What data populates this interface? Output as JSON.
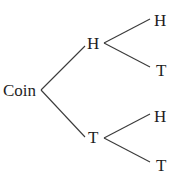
{
  "diagram": {
    "type": "probability-tree",
    "root": {
      "label": "Coin"
    },
    "level1": [
      {
        "label": "H",
        "children": [
          {
            "label": "H"
          },
          {
            "label": "T"
          }
        ]
      },
      {
        "label": "T",
        "children": [
          {
            "label": "H"
          },
          {
            "label": "T"
          }
        ]
      }
    ]
  },
  "colors": {
    "line": "#3a3a3a",
    "text": "#1e1e1e",
    "background": "#ffffff"
  }
}
